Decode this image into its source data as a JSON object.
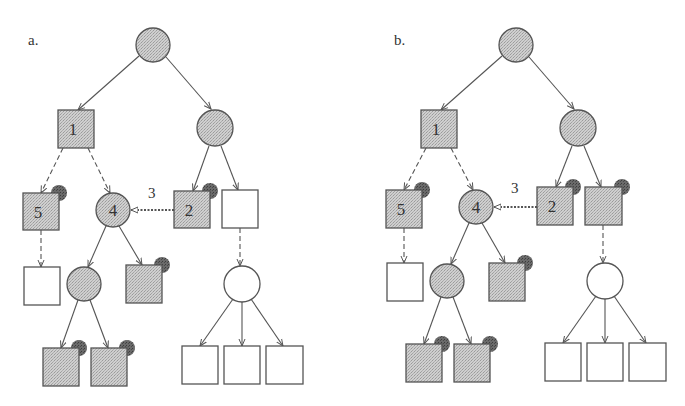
{
  "colors": {
    "shaded_fill": "#c4c4c4",
    "white_fill": "#ffffff",
    "stroke": "#555555",
    "marker_dot": "#555555",
    "text": "#333333"
  },
  "panels": [
    {
      "id": "a",
      "label": "a.",
      "label_pos": [
        28,
        32
      ],
      "offset_x": 0,
      "nodes": [
        {
          "id": "root",
          "shape": "circle",
          "cx": 153,
          "cy": 45,
          "r": 17,
          "fill": "shaded",
          "text": "",
          "dot": false
        },
        {
          "id": "n1",
          "shape": "square",
          "x": 58,
          "y": 110,
          "w": 36,
          "h": 38,
          "fill": "shaded",
          "text": "1",
          "dot": false
        },
        {
          "id": "rc",
          "shape": "circle",
          "cx": 215,
          "cy": 128,
          "r": 18,
          "fill": "shaded",
          "text": "",
          "dot": false
        },
        {
          "id": "n5",
          "shape": "square",
          "x": 23,
          "y": 193,
          "w": 36,
          "h": 37,
          "fill": "shaded",
          "text": "5",
          "dot": true
        },
        {
          "id": "n4",
          "shape": "circle",
          "cx": 113,
          "cy": 210,
          "r": 17,
          "fill": "shaded",
          "text": "4",
          "dot": false
        },
        {
          "id": "n2",
          "shape": "square",
          "x": 174,
          "y": 191,
          "w": 36,
          "h": 37,
          "fill": "shaded",
          "text": "2",
          "dot": true
        },
        {
          "id": "w1",
          "shape": "square",
          "x": 222,
          "y": 190,
          "w": 36,
          "h": 38,
          "fill": "white",
          "text": "",
          "dot": false
        },
        {
          "id": "w5c",
          "shape": "square",
          "x": 24,
          "y": 267,
          "w": 36,
          "h": 38,
          "fill": "white",
          "text": "",
          "dot": false
        },
        {
          "id": "c4a",
          "shape": "circle",
          "cx": 84,
          "cy": 284,
          "r": 17,
          "fill": "shaded",
          "text": "",
          "dot": false
        },
        {
          "id": "s4b",
          "shape": "square",
          "x": 126,
          "y": 265,
          "w": 36,
          "h": 38,
          "fill": "shaded",
          "text": "",
          "dot": true
        },
        {
          "id": "wc",
          "shape": "circle",
          "cx": 242,
          "cy": 284,
          "r": 18,
          "fill": "white",
          "text": "",
          "dot": false
        },
        {
          "id": "l1",
          "shape": "square",
          "x": 43,
          "y": 348,
          "w": 36,
          "h": 38,
          "fill": "shaded",
          "text": "",
          "dot": true
        },
        {
          "id": "l2",
          "shape": "square",
          "x": 91,
          "y": 348,
          "w": 36,
          "h": 38,
          "fill": "shaded",
          "text": "",
          "dot": true
        },
        {
          "id": "wl1",
          "shape": "square",
          "x": 182,
          "y": 346,
          "w": 36,
          "h": 38,
          "fill": "white",
          "text": "",
          "dot": false
        },
        {
          "id": "wl2",
          "shape": "square",
          "x": 224,
          "y": 346,
          "w": 36,
          "h": 38,
          "fill": "white",
          "text": "",
          "dot": false
        },
        {
          "id": "wl3",
          "shape": "square",
          "x": 266,
          "y": 346,
          "w": 37,
          "h": 38,
          "fill": "white",
          "text": "",
          "dot": false
        }
      ],
      "edges": [
        {
          "from": [
            139,
            56
          ],
          "to": [
            78,
            110
          ],
          "style": "solid"
        },
        {
          "from": [
            166,
            57
          ],
          "to": [
            211,
            109
          ],
          "style": "solid"
        },
        {
          "from": [
            63,
            148
          ],
          "to": [
            41,
            193
          ],
          "style": "dashed"
        },
        {
          "from": [
            88,
            148
          ],
          "to": [
            110,
            193
          ],
          "style": "dashed"
        },
        {
          "from": [
            209,
            146
          ],
          "to": [
            193,
            191
          ],
          "style": "solid"
        },
        {
          "from": [
            221,
            146
          ],
          "to": [
            238,
            190
          ],
          "style": "solid"
        },
        {
          "from": [
            41,
            230
          ],
          "to": [
            41,
            267
          ],
          "style": "dashed"
        },
        {
          "from": [
            106,
            226
          ],
          "to": [
            88,
            267
          ],
          "style": "solid"
        },
        {
          "from": [
            119,
            226
          ],
          "to": [
            142,
            265
          ],
          "style": "solid"
        },
        {
          "from": [
            240,
            228
          ],
          "to": [
            240,
            266
          ],
          "style": "dashed"
        },
        {
          "from": [
            78,
            300
          ],
          "to": [
            61,
            348
          ],
          "style": "solid"
        },
        {
          "from": [
            90,
            300
          ],
          "to": [
            108,
            348
          ],
          "style": "solid"
        },
        {
          "from": [
            233,
            299
          ],
          "to": [
            200,
            346
          ],
          "style": "solid"
        },
        {
          "from": [
            242,
            302
          ],
          "to": [
            242,
            346
          ],
          "style": "solid"
        },
        {
          "from": [
            251,
            299
          ],
          "to": [
            283,
            346
          ],
          "style": "solid"
        },
        {
          "from": [
            174,
            210
          ],
          "to": [
            131,
            210
          ],
          "style": "dotted",
          "open_head": true
        }
      ],
      "annotations": [
        {
          "text": "3",
          "x": 148,
          "y": 198
        }
      ]
    },
    {
      "id": "b",
      "label": "b.",
      "label_pos": [
        394,
        32
      ],
      "offset_x": 363,
      "nodes": [
        {
          "id": "root",
          "shape": "circle",
          "cx": 153,
          "cy": 45,
          "r": 17,
          "fill": "shaded",
          "text": "",
          "dot": false
        },
        {
          "id": "n1",
          "shape": "square",
          "x": 58,
          "y": 110,
          "w": 36,
          "h": 38,
          "fill": "shaded",
          "text": "1",
          "dot": false
        },
        {
          "id": "rc",
          "shape": "circle",
          "cx": 215,
          "cy": 128,
          "r": 18,
          "fill": "shaded",
          "text": "",
          "dot": false
        },
        {
          "id": "n5",
          "shape": "square",
          "x": 23,
          "y": 190,
          "w": 36,
          "h": 38,
          "fill": "shaded",
          "text": "5",
          "dot": true
        },
        {
          "id": "n4",
          "shape": "circle",
          "cx": 113,
          "cy": 207,
          "r": 17,
          "fill": "shaded",
          "text": "4",
          "dot": false
        },
        {
          "id": "n2",
          "shape": "square",
          "x": 174,
          "y": 187,
          "w": 36,
          "h": 38,
          "fill": "shaded",
          "text": "2",
          "dot": true
        },
        {
          "id": "w1",
          "shape": "square",
          "x": 222,
          "y": 187,
          "w": 37,
          "h": 38,
          "fill": "shaded",
          "text": "",
          "dot": true
        },
        {
          "id": "w5c",
          "shape": "square",
          "x": 24,
          "y": 263,
          "w": 36,
          "h": 38,
          "fill": "white",
          "text": "",
          "dot": false
        },
        {
          "id": "c4a",
          "shape": "circle",
          "cx": 84,
          "cy": 281,
          "r": 17,
          "fill": "shaded",
          "text": "",
          "dot": false
        },
        {
          "id": "s4b",
          "shape": "square",
          "x": 126,
          "y": 263,
          "w": 36,
          "h": 38,
          "fill": "shaded",
          "text": "",
          "dot": true
        },
        {
          "id": "wc",
          "shape": "circle",
          "cx": 242,
          "cy": 281,
          "r": 18,
          "fill": "white",
          "text": "",
          "dot": false
        },
        {
          "id": "l1",
          "shape": "square",
          "x": 43,
          "y": 344,
          "w": 36,
          "h": 38,
          "fill": "shaded",
          "text": "",
          "dot": true
        },
        {
          "id": "l2",
          "shape": "square",
          "x": 91,
          "y": 344,
          "w": 36,
          "h": 38,
          "fill": "shaded",
          "text": "",
          "dot": true
        },
        {
          "id": "wl1",
          "shape": "square",
          "x": 182,
          "y": 343,
          "w": 36,
          "h": 38,
          "fill": "white",
          "text": "",
          "dot": false
        },
        {
          "id": "wl2",
          "shape": "square",
          "x": 224,
          "y": 343,
          "w": 36,
          "h": 38,
          "fill": "white",
          "text": "",
          "dot": false
        },
        {
          "id": "wl3",
          "shape": "square",
          "x": 266,
          "y": 343,
          "w": 37,
          "h": 38,
          "fill": "white",
          "text": "",
          "dot": false
        }
      ],
      "edges": [
        {
          "from": [
            139,
            56
          ],
          "to": [
            78,
            110
          ],
          "style": "solid"
        },
        {
          "from": [
            166,
            57
          ],
          "to": [
            211,
            109
          ],
          "style": "solid"
        },
        {
          "from": [
            63,
            148
          ],
          "to": [
            41,
            190
          ],
          "style": "dashed"
        },
        {
          "from": [
            88,
            148
          ],
          "to": [
            110,
            190
          ],
          "style": "dashed"
        },
        {
          "from": [
            209,
            146
          ],
          "to": [
            193,
            187
          ],
          "style": "solid"
        },
        {
          "from": [
            221,
            146
          ],
          "to": [
            238,
            187
          ],
          "style": "solid"
        },
        {
          "from": [
            41,
            228
          ],
          "to": [
            41,
            263
          ],
          "style": "dashed"
        },
        {
          "from": [
            106,
            223
          ],
          "to": [
            88,
            264
          ],
          "style": "solid"
        },
        {
          "from": [
            119,
            223
          ],
          "to": [
            142,
            263
          ],
          "style": "solid"
        },
        {
          "from": [
            240,
            225
          ],
          "to": [
            240,
            263
          ],
          "style": "dashed"
        },
        {
          "from": [
            78,
            297
          ],
          "to": [
            61,
            344
          ],
          "style": "solid"
        },
        {
          "from": [
            90,
            297
          ],
          "to": [
            108,
            344
          ],
          "style": "solid"
        },
        {
          "from": [
            233,
            296
          ],
          "to": [
            200,
            343
          ],
          "style": "solid"
        },
        {
          "from": [
            242,
            299
          ],
          "to": [
            242,
            343
          ],
          "style": "solid"
        },
        {
          "from": [
            251,
            296
          ],
          "to": [
            283,
            343
          ],
          "style": "solid"
        },
        {
          "from": [
            174,
            207
          ],
          "to": [
            131,
            207
          ],
          "style": "dotted",
          "open_head": true
        }
      ],
      "annotations": [
        {
          "text": "3",
          "x": 148,
          "y": 193
        }
      ]
    }
  ]
}
